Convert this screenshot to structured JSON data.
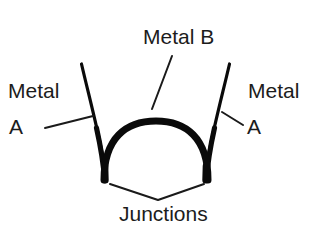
{
  "diagram": {
    "background_color": "#ffffff",
    "ink_color": "#0a0a0a",
    "labels": {
      "metal_b": "Metal B",
      "left_metal": "Metal",
      "left_metal_suffix": "A",
      "right_metal": "Metal",
      "right_metal_suffix": "A",
      "junctions": "Junctions"
    },
    "geometry": {
      "left_wire_top": [
        81,
        64
      ],
      "left_junction": [
        105,
        180
      ],
      "right_wire_top": [
        230,
        64
      ],
      "right_junction": [
        210,
        180
      ],
      "arc_apex": [
        158,
        121
      ],
      "arc_thickness_px": 7,
      "leader_v_apex": [
        158,
        200
      ]
    }
  }
}
